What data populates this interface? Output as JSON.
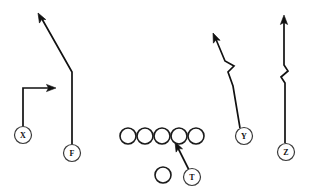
{
  "diagram": {
    "width": 313,
    "height": 193,
    "background_color": "#ffffff",
    "line_color": "#111111",
    "marker_fill": "#ffffff",
    "marker_stroke": "#3a3a3a"
  },
  "players": [
    {
      "id": "X",
      "label": "X",
      "name": "split-end-x",
      "position": "split end",
      "cx": 23,
      "cy": 135,
      "r": 8.5
    },
    {
      "id": "F",
      "label": "F",
      "name": "flanker-f",
      "position": "flanker",
      "cx": 72,
      "cy": 153,
      "r": 8.5
    },
    {
      "id": "T",
      "label": "T",
      "name": "tailback-t",
      "position": "tailback",
      "cx": 192,
      "cy": 177,
      "r": 8.5
    },
    {
      "id": "Y",
      "label": "Y",
      "name": "tight-end-y",
      "position": "tight end",
      "cx": 244,
      "cy": 136,
      "r": 8.5
    },
    {
      "id": "Z",
      "label": "Z",
      "name": "wide-receiver-z",
      "position": "wide receiver",
      "cx": 286,
      "cy": 152,
      "r": 8.5
    }
  ],
  "linemen": [
    {
      "name": "lineman-left-tackle",
      "cx": 128,
      "cy": 136,
      "r": 8.0
    },
    {
      "name": "lineman-left-guard",
      "cx": 145,
      "cy": 136,
      "r": 8.0
    },
    {
      "name": "lineman-center",
      "cx": 162,
      "cy": 136,
      "r": 8.0
    },
    {
      "name": "lineman-right-guard",
      "cx": 179,
      "cy": 136,
      "r": 8.0
    },
    {
      "name": "lineman-right-tackle",
      "cx": 196,
      "cy": 136,
      "r": 8.0
    }
  ],
  "backfield": [
    {
      "name": "backfield-back-circle",
      "cx": 163,
      "cy": 175,
      "r": 8.0
    }
  ],
  "routes": [
    {
      "name": "route-x",
      "player": "X",
      "description": "vertical stem then break out to the right (out route)",
      "path": "M 23 126 L 23 88 L 51 88",
      "arrow": {
        "tip_x": 56,
        "tip_y": 88,
        "angle": 0
      }
    },
    {
      "name": "route-f",
      "player": "F",
      "description": "vertical stem then break diagonally up and to the left (post route)",
      "path": "M 72 144 L 72 72 L 42 19",
      "arrow": {
        "tip_x": 38,
        "tip_y": 13,
        "angle": -119
      }
    },
    {
      "name": "route-y",
      "player": "Y",
      "description": "diagonal up-and-left with a zigzag release break",
      "path": "M 240 128 L 233 86 L 228 72 L 234 66 L 225 61 L 215 37",
      "arrow": {
        "tip_x": 213,
        "tip_y": 33,
        "angle": -113
      }
    },
    {
      "name": "route-z",
      "player": "Z",
      "description": "straight vertical go route with a zigzag release break",
      "path": "M 285 143 L 285 83 L 281 77 L 288 71 L 284 65 L 284 21",
      "arrow": {
        "tip_x": 284,
        "tip_y": 15,
        "angle": -90
      }
    },
    {
      "name": "route-t",
      "player": "T",
      "description": "tailback path up and to the left toward the right guard gap",
      "path": "M 189 170 L 177 146",
      "arrow": {
        "tip_x": 175,
        "tip_y": 142,
        "angle": -117
      }
    }
  ]
}
